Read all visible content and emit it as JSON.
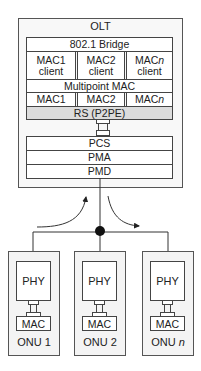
{
  "olt": {
    "title": "OLT",
    "bridge": "802.1 Bridge",
    "clients": [
      {
        "line1": "MAC1",
        "line2": "client"
      },
      {
        "line1": "MAC2",
        "line2": "client"
      },
      {
        "line1": "MAC",
        "line1_italic": "n",
        "line2": "client"
      }
    ],
    "multipoint_mac": "Multipoint MAC",
    "macs": [
      {
        "label": "MAC1"
      },
      {
        "label": "MAC2"
      },
      {
        "label": "MAC",
        "italic": "n"
      }
    ],
    "rs": "RS (P2PE)",
    "phy_layers": [
      "PCS",
      "PMA",
      "PMD"
    ]
  },
  "onus": [
    {
      "phy": "PHY",
      "mac": "MAC",
      "label": "ONU 1",
      "label_italic": ""
    },
    {
      "phy": "PHY",
      "mac": "MAC",
      "label": "ONU 2",
      "label_italic": ""
    },
    {
      "phy": "PHY",
      "mac": "MAC",
      "label": "ONU ",
      "label_italic": "n"
    }
  ],
  "colors": {
    "line": "#333333",
    "rs_fill": "#dcdcdc",
    "box_fill": "#f6f6f6"
  }
}
